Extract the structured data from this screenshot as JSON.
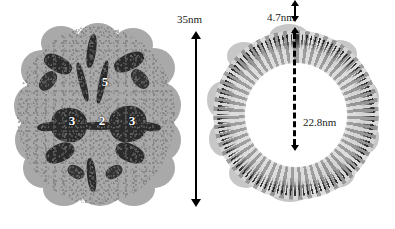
{
  "figure": {
    "panels": [
      {
        "id": "capsid-surface",
        "name": "capsid-surface-rendering",
        "symmetry_labels": [
          {
            "value": "5",
            "axis": "five-fold",
            "x": 105,
            "y": 82
          },
          {
            "value": "3",
            "axis": "three-fold-left",
            "x": 72,
            "y": 122
          },
          {
            "value": "2",
            "axis": "two-fold",
            "x": 102,
            "y": 121
          },
          {
            "value": "3",
            "axis": "three-fold-right",
            "x": 132,
            "y": 122
          }
        ]
      },
      {
        "id": "capsid-cross-section",
        "name": "capsid-cross-section-ring"
      }
    ],
    "dimensions": [
      {
        "id": "overall-diameter",
        "label": "35nm",
        "style": "solid-double-arrow",
        "orientation": "vertical"
      },
      {
        "id": "shell-thickness",
        "label": "4.7nm",
        "style": "solid-double-arrow",
        "orientation": "vertical"
      },
      {
        "id": "lumen-diameter",
        "label": "22.8nm",
        "style": "dashed-double-arrow",
        "orientation": "vertical"
      }
    ],
    "colors": {
      "background": "#ffffff",
      "capsid_surface": "#a9a9a9",
      "capsid_groove": "#2b2b2b",
      "ring_outer": "#b4b4b4",
      "ring_shell": "#101010",
      "lumen": "#ffffff",
      "annotation": "#000000",
      "axis_label_text": "#ffffff"
    }
  }
}
